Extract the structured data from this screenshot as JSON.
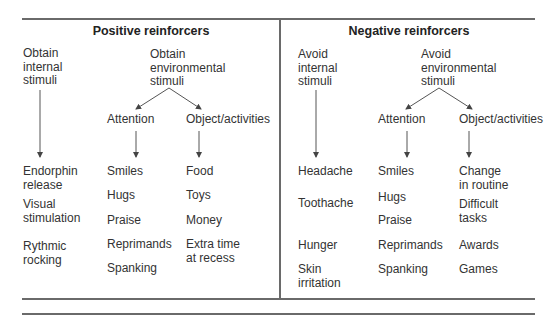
{
  "diagram": {
    "positive": {
      "title": "Positive reinforcers",
      "internal_header": "Obtain\ninternal\nstimuli",
      "environmental_header": "Obtain\nenvironmental\nstimuli",
      "attention_header": "Attention",
      "object_header": "Object/activities",
      "internal_items": [
        "Endorphin\nrelease",
        "Visual\nstimulation",
        "Rythmic\nrocking"
      ],
      "attention_items": [
        "Smiles",
        "Hugs",
        "Praise",
        "Reprimands",
        "Spanking"
      ],
      "object_items": [
        "Food",
        "Toys",
        "Money",
        "Extra time\nat recess"
      ]
    },
    "negative": {
      "title": "Negative reinforcers",
      "internal_header": "Avoid\ninternal\nstimuli",
      "environmental_header": "Avoid\nenvironmental\nstimuli",
      "attention_header": "Attention",
      "object_header": "Object/activities",
      "internal_items": [
        "Headache",
        "Toothache",
        "Hunger",
        "Skin\nirritation"
      ],
      "attention_items": [
        "Smiles",
        "Hugs",
        "Praise",
        "Reprimands",
        "Spanking"
      ],
      "object_items": [
        "Change\nin routine",
        "Difficult\ntasks",
        "Awards",
        "Games"
      ]
    },
    "colors": {
      "line": "#6a6a6a",
      "text": "#333333"
    }
  }
}
